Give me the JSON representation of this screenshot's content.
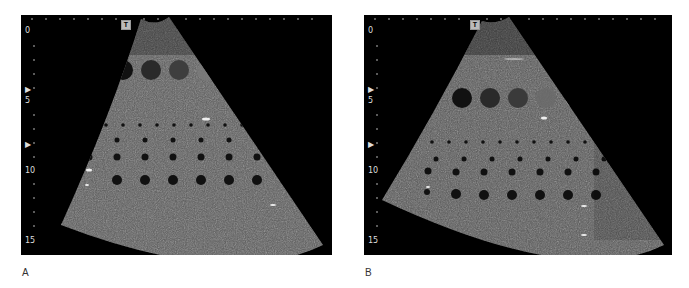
{
  "figure": {
    "panels": [
      {
        "id": "A",
        "label": "A",
        "transducer_marker": "T",
        "depth_scale": [
          "0",
          "5",
          "10",
          "15"
        ],
        "focus_markers": [
          "▶",
          "▶"
        ],
        "description": "Ultrasound sector image of phantom with contrast targets and anechoic cysts"
      },
      {
        "id": "B",
        "label": "B",
        "transducer_marker": "T",
        "depth_scale": [
          "0",
          "5",
          "10",
          "15"
        ],
        "focus_markers": [
          "▶",
          "▶"
        ],
        "description": "Ultrasound sector image of phantom with contrast targets and anechoic cysts"
      }
    ],
    "colors": {
      "background": "#000000",
      "tissue": "#6e6e6e",
      "scale_text": "#dddddd",
      "page": "#ffffff"
    }
  }
}
